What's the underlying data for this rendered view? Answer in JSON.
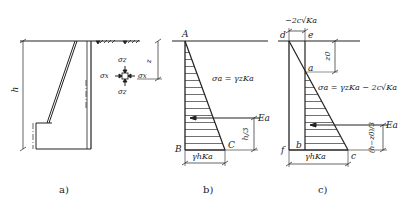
{
  "diagram": {
    "subfigures": [
      {
        "id": "a",
        "caption": "a)",
        "description": "Retaining wall cross-section with backfill surface and soil element stresses",
        "labels": {
          "height": "h",
          "sigma_z_top": "σz",
          "sigma_z_bottom": "σz",
          "sigma_x_left": "σx",
          "sigma_x_right": "σx",
          "depth": "z"
        }
      },
      {
        "id": "b",
        "caption": "b)",
        "description": "Active earth pressure distribution, cohesionless soil",
        "labels": {
          "point_A": "A",
          "point_B": "B",
          "point_C": "C",
          "equation": "σa = γzKa",
          "resultant": "Ea",
          "resultant_height": "h/3",
          "base_value": "γhKa"
        }
      },
      {
        "id": "c",
        "caption": "c)",
        "description": "Active earth pressure distribution, cohesive soil with tension crack depth z0",
        "labels": {
          "top_value": "−2c√Ka",
          "point_d": "d",
          "point_e": "e",
          "point_a": "a",
          "point_b": "b",
          "point_c": "c",
          "point_f": "f",
          "crack_depth": "z0",
          "equation": "σa = γzKa − 2c√Ka",
          "resultant": "Ea",
          "resultant_height": "(h−z0)/3",
          "base_value": "γhKa"
        }
      }
    ]
  }
}
